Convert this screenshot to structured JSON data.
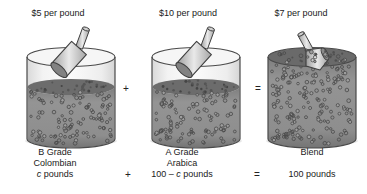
{
  "figure": {
    "panels": [
      {
        "price": "$5 per pound",
        "grade": "B Grade",
        "variety": "Colombian",
        "amount_prefix": "",
        "amount_var": "c",
        "amount_suffix": " pounds"
      },
      {
        "price": "$10 per pound",
        "grade": "A Grade",
        "variety": "Arabica",
        "amount_prefix": "100 – ",
        "amount_var": "c",
        "amount_suffix": " pounds"
      },
      {
        "price": "$7 per pound",
        "grade": "Blend",
        "variety": "",
        "amount_prefix": "",
        "amount_var": "",
        "amount_suffix": "100 pounds"
      }
    ],
    "operators": {
      "plus": "+",
      "equals": "="
    },
    "colors": {
      "outline": "#4a4a4a",
      "bean_mass": "#8f8f8f",
      "bean_surface": "#6c6c6c",
      "glass": "#f4f4f4",
      "scoop_metal": "#d9d9d9"
    }
  }
}
